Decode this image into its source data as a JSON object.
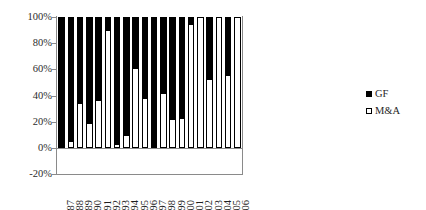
{
  "chart_data": {
    "type": "bar",
    "stacked": true,
    "percent_stacked": true,
    "title": "",
    "xlabel": "",
    "ylabel": "",
    "ylim": [
      -20,
      100
    ],
    "ytick_labels": [
      "100%",
      "80%",
      "60%",
      "40%",
      "20%",
      "0%",
      "-20%"
    ],
    "ytick_values": [
      100,
      80,
      60,
      40,
      20,
      0,
      -20
    ],
    "grid": false,
    "legend_position": "right",
    "categories": [
      "1987",
      "1988",
      "1989",
      "1990",
      "1991",
      "1992",
      "1993",
      "1994",
      "1995",
      "1996",
      "1997",
      "1998",
      "1999",
      "2000",
      "2001",
      "2002",
      "2003",
      "2004",
      "2005",
      "2006"
    ],
    "series": [
      {
        "name": "M&A",
        "color": "#ffffff",
        "values": [
          0,
          5,
          34,
          19,
          37,
          90,
          3,
          10,
          61,
          38,
          0,
          42,
          22,
          23,
          95,
          100,
          53,
          100,
          56,
          100
        ]
      },
      {
        "name": "GF",
        "color": "#000000",
        "values": [
          100,
          95,
          66,
          81,
          63,
          10,
          97,
          90,
          39,
          62,
          100,
          58,
          78,
          77,
          5,
          0,
          47,
          0,
          44,
          0
        ]
      }
    ]
  },
  "legend": {
    "items": [
      {
        "label": "GF",
        "swatch": "filled-square-black"
      },
      {
        "label": "M&A",
        "swatch": "outlined-square-white"
      }
    ]
  },
  "axes": {
    "y": {
      "labels": [
        "100%",
        "80%",
        "60%",
        "40%",
        "20%",
        "0%",
        "-20%"
      ]
    },
    "x": {
      "labels": [
        "1987",
        "1988",
        "1989",
        "1990",
        "1991",
        "1992",
        "1993",
        "1994",
        "1995",
        "1996",
        "1997",
        "1998",
        "1999",
        "2000",
        "2001",
        "2002",
        "2003",
        "2004",
        "2005",
        "2006"
      ]
    }
  }
}
